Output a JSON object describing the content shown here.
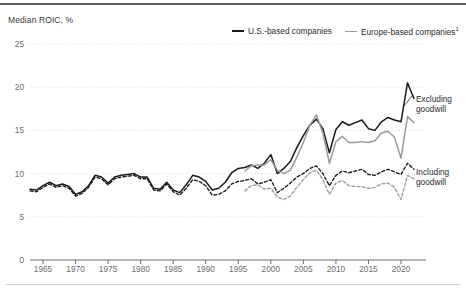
{
  "axis_title": "Median ROIC, %",
  "legend": [
    {
      "label": "U.S.-based companies",
      "color": "#1a1a1a",
      "style": "solid",
      "icon": "line-swatch-icon"
    },
    {
      "label": "Europe-based companies",
      "footnote": "1",
      "color": "#9a9a9a",
      "style": "solid",
      "icon": "line-swatch-icon"
    }
  ],
  "annotations": [
    {
      "name": "excluding-goodwill",
      "line1": "Excluding",
      "line2": "goodwill"
    },
    {
      "name": "including-goodwill",
      "line1": "Including",
      "line2": "goodwill"
    }
  ],
  "chart_data": {
    "type": "line",
    "title": "",
    "xlabel": "",
    "ylabel": "Median ROIC, %",
    "xlim": [
      1963,
      2022
    ],
    "ylim": [
      0,
      25
    ],
    "yticks": [
      0,
      5,
      10,
      15,
      20,
      25
    ],
    "xticks": [
      1965,
      1970,
      1975,
      1980,
      1985,
      1990,
      1995,
      2000,
      2005,
      2010,
      2015,
      2020
    ],
    "grid": "horizontal-dotted",
    "legend_position": "top-right",
    "series": [
      {
        "name": "U.S.-based companies, excluding goodwill",
        "color": "#1a1a1a",
        "dash": "solid",
        "x": [
          1963,
          1964,
          1965,
          1966,
          1967,
          1968,
          1969,
          1970,
          1971,
          1972,
          1973,
          1974,
          1975,
          1976,
          1977,
          1978,
          1979,
          1980,
          1981,
          1982,
          1983,
          1984,
          1985,
          1986,
          1987,
          1988,
          1989,
          1990,
          1991,
          1992,
          1993,
          1994,
          1995,
          1996,
          1997,
          1998,
          1999,
          2000,
          2001,
          2002,
          2003,
          2004,
          2005,
          2006,
          2007,
          2008,
          2009,
          2010,
          2011,
          2012,
          2013,
          2014,
          2015,
          2016,
          2017,
          2018,
          2019,
          2020,
          2021,
          2022
        ],
        "values": [
          8.2,
          8.1,
          8.6,
          9.0,
          8.6,
          8.8,
          8.5,
          7.6,
          7.9,
          8.6,
          9.8,
          9.6,
          8.9,
          9.6,
          9.8,
          9.9,
          10.0,
          9.6,
          9.6,
          8.3,
          8.2,
          9.0,
          8.1,
          7.8,
          8.7,
          9.8,
          9.6,
          9.1,
          8.1,
          8.3,
          9.0,
          10.1,
          10.6,
          10.7,
          11.0,
          10.6,
          11.2,
          12.2,
          10.0,
          10.6,
          11.4,
          13.0,
          14.4,
          15.6,
          16.3,
          15.2,
          12.4,
          15.1,
          16.0,
          15.6,
          15.9,
          16.2,
          15.2,
          15.0,
          16.0,
          16.5,
          16.2,
          16.0,
          20.5,
          18.7
        ]
      },
      {
        "name": "Europe-based companies, excluding goodwill",
        "color": "#9a9a9a",
        "dash": "solid",
        "x": [
          1996,
          1997,
          1998,
          1999,
          2000,
          2001,
          2002,
          2003,
          2004,
          2005,
          2006,
          2007,
          2008,
          2009,
          2010,
          2011,
          2012,
          2013,
          2014,
          2015,
          2016,
          2017,
          2018,
          2019,
          2020,
          2021,
          2022
        ],
        "values": [
          10.3,
          10.9,
          11.0,
          11.0,
          11.6,
          10.4,
          10.0,
          10.4,
          11.9,
          13.6,
          15.6,
          16.8,
          14.7,
          11.2,
          13.7,
          14.3,
          13.6,
          13.6,
          13.7,
          13.6,
          13.8,
          14.7,
          14.9,
          14.2,
          11.8,
          16.6,
          15.9
        ]
      },
      {
        "name": "U.S.-based companies, including goodwill",
        "color": "#1a1a1a",
        "dash": "dashed",
        "x": [
          1963,
          1964,
          1965,
          1966,
          1967,
          1968,
          1969,
          1970,
          1971,
          1972,
          1973,
          1974,
          1975,
          1976,
          1977,
          1978,
          1979,
          1980,
          1981,
          1982,
          1983,
          1984,
          1985,
          1986,
          1987,
          1988,
          1989,
          1990,
          1991,
          1992,
          1993,
          1994,
          1995,
          1996,
          1997,
          1998,
          1999,
          2000,
          2001,
          2002,
          2003,
          2004,
          2005,
          2006,
          2007,
          2008,
          2009,
          2010,
          2011,
          2012,
          2013,
          2014,
          2015,
          2016,
          2017,
          2018,
          2019,
          2020,
          2021,
          2022
        ],
        "values": [
          8.0,
          7.9,
          8.4,
          8.8,
          8.4,
          8.6,
          8.3,
          7.4,
          7.7,
          8.4,
          9.6,
          9.4,
          8.7,
          9.4,
          9.6,
          9.7,
          9.8,
          9.4,
          9.4,
          8.1,
          8.0,
          8.8,
          7.9,
          7.5,
          8.3,
          9.3,
          9.1,
          8.6,
          7.5,
          7.6,
          8.0,
          8.8,
          9.1,
          9.2,
          9.4,
          8.8,
          9.0,
          9.3,
          7.8,
          8.3,
          8.9,
          9.6,
          10.0,
          10.6,
          10.9,
          10.0,
          8.6,
          9.8,
          10.3,
          10.1,
          10.3,
          10.5,
          9.9,
          9.8,
          10.2,
          10.5,
          10.2,
          9.9,
          11.2,
          10.5
        ]
      },
      {
        "name": "Europe-based companies, including goodwill",
        "color": "#9a9a9a",
        "dash": "dashed",
        "x": [
          1996,
          1997,
          1998,
          1999,
          2000,
          2001,
          2002,
          2003,
          2004,
          2005,
          2006,
          2007,
          2008,
          2009,
          2010,
          2011,
          2012,
          2013,
          2014,
          2015,
          2016,
          2017,
          2018,
          2019,
          2020,
          2021,
          2022
        ],
        "values": [
          8.0,
          8.6,
          8.7,
          8.2,
          8.3,
          7.3,
          7.0,
          7.4,
          8.4,
          9.3,
          10.1,
          10.4,
          9.3,
          7.6,
          8.9,
          9.2,
          8.6,
          8.5,
          8.5,
          8.3,
          8.4,
          8.8,
          8.9,
          8.4,
          7.0,
          9.8,
          9.4
        ]
      }
    ]
  }
}
